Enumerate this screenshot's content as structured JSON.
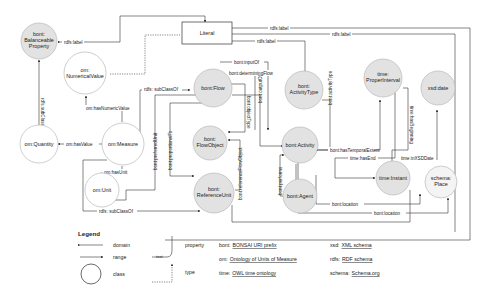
{
  "nodes": {
    "balanceable_property": [
      "bont:",
      "Balanceable",
      "Property"
    ],
    "numerical_value": [
      "om:",
      "NumericalValue"
    ],
    "quantity": [
      "om:Quantity"
    ],
    "measure": [
      "om:Measure"
    ],
    "unit": [
      "om:Unit"
    ],
    "flow": [
      "bont:Flow"
    ],
    "flow_object": [
      "bont:",
      "FlowObject"
    ],
    "reference_unit": [
      "bont:",
      "ReferenceUnit"
    ],
    "activity_type": [
      "bont:",
      "ActivityType"
    ],
    "activity": [
      "bont:Activity"
    ],
    "agent": [
      "bont:Agent"
    ],
    "proper_interval": [
      "time:",
      "ProperInterval"
    ],
    "instant": [
      "time:Instant"
    ],
    "xsd_date": [
      "xsd:date"
    ],
    "place": [
      "schema:",
      "Place"
    ],
    "literal": "Literal"
  },
  "edges": {
    "rdfs_label_1": "rdfs:label",
    "rdfs_label_2": "rdfs:label",
    "rdfs_label_3": "rdfs:label",
    "rdfs_label_4": "rdfs:label",
    "rdfs_subclassof_balanceable": "rdfs:subClassOf",
    "rdfs_subclassof_flow": "rdfs: subClassOf",
    "rdfs_subclassof_refunit": "rdfs: subClassOf",
    "has_numeric_value": "om:hasNumericValue",
    "has_value": "om:hasValue",
    "has_unit": "om:hasUnit",
    "input_of": "bont:inputOf",
    "determining_flow": "bont:determiningFlow",
    "object_type": "bont:objectType",
    "output_of": "bont:outputOf",
    "proportional_to": "bont:proportionalTo",
    "reference_flow_object": "bont:referenceFlowObject",
    "prefer_unit": "bont:preferredUnit",
    "activity_type": "bont:activityType",
    "performs": "bont:performs",
    "determines_interval": "bont:hasTemporalExtent",
    "has_end": "time:hasEnd",
    "has_beginning": "time:hasBeginning",
    "in_xsd_date": "time:inXSDDate",
    "location_1": "bont:location",
    "location_2": "bont:location"
  },
  "legend": {
    "title": "Legend",
    "domain": "domain",
    "range": "range",
    "class": "class",
    "text": "text",
    "property": "property",
    "type": "type",
    "prefixes": [
      {
        "prefix": "bont:",
        "name": "BONSAI URI prefix"
      },
      {
        "prefix": "om:",
        "name": "Ontology of Units of Measure"
      },
      {
        "prefix": "time:",
        "name": "OWL time ontology"
      },
      {
        "prefix": "xsd:",
        "name": "XML schema"
      },
      {
        "prefix": "rdfs:",
        "name": "RDF schema"
      },
      {
        "prefix": "schema:",
        "name": "Schema.org"
      }
    ]
  }
}
